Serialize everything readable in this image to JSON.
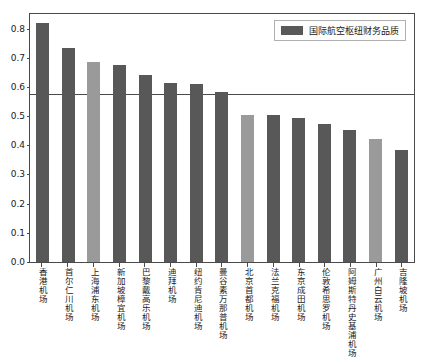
{
  "chart_data": {
    "type": "bar",
    "title": "",
    "xlabel": "",
    "ylabel": "",
    "ylim": [
      0.0,
      0.85
    ],
    "grid": false,
    "legend_position": "top-right",
    "categories": [
      "香港机场",
      "首尔仁川机场",
      "上海浦东机场",
      "新加坡樟宜机场",
      "巴黎戴高乐机场",
      "迪拜机场",
      "纽约肯尼迪机场",
      "曼谷素万那普机场",
      "北京首都机场",
      "法兰克福机场",
      "东京成田机场",
      "伦敦希思罗机场",
      "阿姆斯特丹史基浦机场",
      "广州白云机场",
      "吉隆坡机场"
    ],
    "values": [
      0.82,
      0.735,
      0.685,
      0.675,
      0.64,
      0.612,
      0.611,
      0.583,
      0.503,
      0.503,
      0.492,
      0.473,
      0.452,
      0.421,
      0.385
    ],
    "series": [
      {
        "name": "国际航空枢纽财务品质",
        "values": [
          0.82,
          0.735,
          0.685,
          0.675,
          0.64,
          0.612,
          0.611,
          0.583,
          0.503,
          0.503,
          0.492,
          0.473,
          0.452,
          0.421,
          0.385
        ]
      }
    ],
    "highlighted_indices": [
      2,
      8,
      13
    ],
    "reference_line": 0.575,
    "yticks": [
      "0.0",
      "0.1",
      "0.2",
      "0.3",
      "0.4",
      "0.5",
      "0.6",
      "0.7",
      "0.8"
    ],
    "ytick_values": [
      0.0,
      0.1,
      0.2,
      0.3,
      0.4,
      0.5,
      0.6,
      0.7,
      0.8
    ],
    "colors": {
      "bar": "#585858",
      "bar_highlight": "#9a9a9a",
      "axis": "#4a4a4a",
      "reference_line": "#4a4a4a",
      "background": "#ffffff"
    }
  },
  "legend": {
    "label": "国际航空枢纽财务品质"
  }
}
